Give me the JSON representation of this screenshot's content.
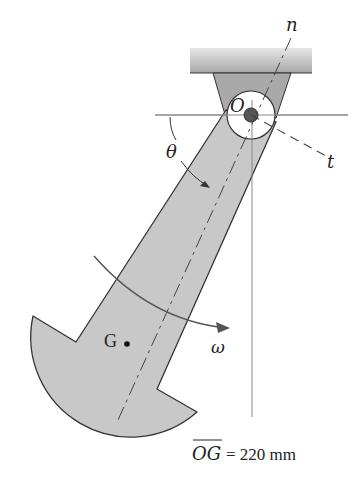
{
  "figure": {
    "labels": {
      "pivot": "O",
      "normal_axis": "n",
      "tangent_axis": "t",
      "angle": "θ",
      "center_of_mass": "G",
      "angular_velocity": "ω"
    },
    "dimension": {
      "segment": "OG",
      "equals": "= 220 mm",
      "value": 220,
      "unit": "mm"
    }
  },
  "colors": {
    "body_fill": "#c8c8c8",
    "bracket_fill": "#a9a9a9",
    "ceiling_fill": "#b5b5b5",
    "outline": "#333333",
    "background": "#ffffff"
  }
}
